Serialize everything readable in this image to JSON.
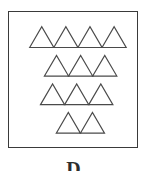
{
  "figure": {
    "label": "D",
    "caption_clipped": true,
    "box": {
      "x": 8,
      "y": 11,
      "width": 130,
      "height": 137,
      "border_color": "#3a3a3a",
      "border_width": 1.5,
      "fill_color": "#ffffff"
    },
    "shape_name": "triangle",
    "shape_stroke_color": "#4a4a4a",
    "shape_fill_color": "none",
    "shape_stroke_width": 1.2,
    "total_count": 12,
    "rows": [
      {
        "index": 1,
        "count": 4,
        "start_x": 21,
        "baseline_y": 36,
        "tri_width": 24.5,
        "tri_height": 21
      },
      {
        "index": 2,
        "count": 3,
        "start_x": 36,
        "baseline_y": 65,
        "tri_width": 24.5,
        "tri_height": 21
      },
      {
        "index": 3,
        "count": 3,
        "start_x": 32,
        "baseline_y": 94,
        "tri_width": 24.5,
        "tri_height": 21
      },
      {
        "index": 4,
        "count": 2,
        "start_x": 48,
        "baseline_y": 123,
        "tri_width": 24.5,
        "tri_height": 21
      }
    ]
  },
  "chart_data": {
    "type": "bar",
    "title": "D",
    "xlabel": "",
    "ylabel": "Triangles per row",
    "categories": [
      "Row 1",
      "Row 2",
      "Row 3",
      "Row 4"
    ],
    "values": [
      4,
      3,
      3,
      2
    ],
    "ylim": [
      0,
      4
    ],
    "grid": false,
    "legend": "none",
    "annotations": [
      "Total triangles: 12"
    ]
  }
}
